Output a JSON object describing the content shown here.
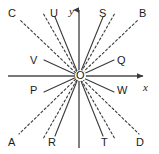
{
  "figure": {
    "width": 159,
    "height": 154,
    "background": "#ffffff",
    "line_color": "#3a3a3a",
    "axis_color": "#4a4a4a",
    "text_color": "#1b1b1b",
    "origin": {
      "label": "O",
      "x": 79,
      "y": 76
    }
  },
  "axes": {
    "x": {
      "label": "x",
      "style": "solid",
      "arrow": "right",
      "label_x": 143,
      "label_y": 84
    },
    "y": {
      "label": "y",
      "style": "solid",
      "arrow": "up",
      "label_x": 69,
      "label_y": 7
    }
  },
  "rays": [
    {
      "label": "C",
      "style": "dashed",
      "label_x": 8,
      "label_y": 8,
      "end_x": 22,
      "end_y": 22
    },
    {
      "label": "U",
      "style": "solid",
      "label_x": 50,
      "label_y": 8,
      "end_x": 57,
      "end_y": 22
    },
    {
      "label": "S",
      "style": "solid",
      "label_x": 99,
      "label_y": 8,
      "end_x": 101,
      "end_y": 22
    },
    {
      "label": "B",
      "style": "dashed",
      "label_x": 139,
      "label_y": 8,
      "end_x": 134,
      "end_y": 22
    },
    {
      "label": "V",
      "style": "solid",
      "label_x": 30,
      "label_y": 55,
      "end_x": 42,
      "end_y": 61
    },
    {
      "label": "Q",
      "style": "solid",
      "label_x": 117,
      "label_y": 55,
      "end_x": 114,
      "end_y": 61
    },
    {
      "label": "P",
      "style": "solid",
      "label_x": 30,
      "label_y": 85,
      "end_x": 42,
      "end_y": 91
    },
    {
      "label": "W",
      "style": "solid",
      "label_x": 117,
      "label_y": 85,
      "end_x": 114,
      "end_y": 91
    },
    {
      "label": "A",
      "style": "dashed",
      "label_x": 8,
      "label_y": 137,
      "end_x": 22,
      "end_y": 131
    },
    {
      "label": "R",
      "style": "solid",
      "label_x": 48,
      "label_y": 137,
      "end_x": 57,
      "end_y": 131
    },
    {
      "label": "T",
      "style": "solid",
      "label_x": 101,
      "label_y": 137,
      "end_x": 101,
      "end_y": 131
    },
    {
      "label": "D",
      "style": "dashed",
      "label_x": 136,
      "label_y": 137,
      "end_x": 134,
      "end_y": 131
    }
  ]
}
